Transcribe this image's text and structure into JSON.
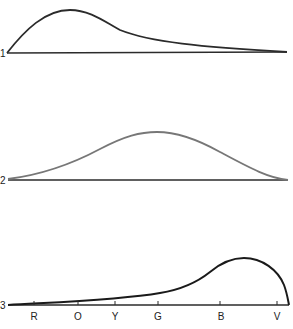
{
  "diagram": {
    "type": "spectral-distribution-curves",
    "curves": [
      {
        "id": "1",
        "label": "1",
        "color": "#2b2b2b",
        "description": "peak toward red/orange end, long tail to violet"
      },
      {
        "id": "2",
        "label": "2",
        "color": "#777777",
        "description": "symmetric peak centered near green"
      },
      {
        "id": "3",
        "label": "3",
        "color": "#1a1a1a",
        "description": "low across red-green, peak in blue-violet, sharp drop at violet end"
      }
    ],
    "axis": {
      "tick_labels": [
        "R",
        "O",
        "Y",
        "G",
        "B",
        "V"
      ]
    }
  }
}
